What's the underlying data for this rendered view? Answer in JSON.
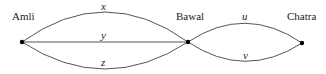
{
  "nodes": [
    {
      "id": "amli",
      "label": "Amli",
      "x": 22,
      "y": 42
    },
    {
      "id": "bawal",
      "label": "Bawal",
      "x": 188,
      "y": 42
    },
    {
      "id": "chatra",
      "label": "Chatra",
      "x": 302,
      "y": 43
    }
  ],
  "edges": [
    {
      "label": "x",
      "from": "Amli",
      "to": "Bawal"
    },
    {
      "label": "y",
      "from": "Amli",
      "to": "Bawal"
    },
    {
      "label": "z",
      "from": "Amli",
      "to": "Bawal"
    },
    {
      "label": "u",
      "from": "Bawal",
      "to": "Chatra"
    },
    {
      "label": "v",
      "from": "Bawal",
      "to": "Chatra"
    }
  ],
  "colors": {
    "line": "#555555",
    "node": "#000000"
  }
}
